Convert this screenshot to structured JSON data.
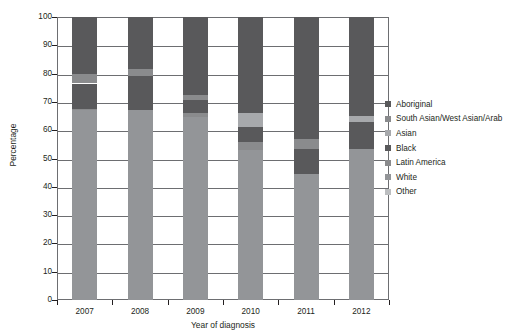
{
  "chart_data": {
    "type": "bar",
    "stacked": true,
    "title": "",
    "subtitle": "",
    "xlabel": "Year of diagnosis",
    "ylabel": "Percentage",
    "categories": [
      "2007",
      "2008",
      "2009",
      "2010",
      "2011",
      "2012"
    ],
    "ylim": [
      0,
      100
    ],
    "yticks": [
      0,
      10,
      20,
      30,
      40,
      50,
      60,
      70,
      80,
      90,
      100
    ],
    "ytick_labels": [
      "0",
      "10",
      "20",
      "30",
      "40",
      "50",
      "60",
      "70",
      "80",
      "90",
      "100"
    ],
    "grid": true,
    "grid_axis": "y",
    "legend_position": "right",
    "legend_entries": [
      "Aboriginal",
      "South Asian/West Asian/Arab",
      "Asian",
      "Black",
      "Latin America",
      "White",
      "Other"
    ],
    "series": [
      {
        "name": "Aboriginal",
        "color": "#59595b",
        "values": [
          20.0,
          18.5,
          27.5,
          34.0,
          43.0,
          35.0
        ]
      },
      {
        "name": "South Asian/West Asian/Arab",
        "color": "#8a8b8d",
        "values": [
          3.5,
          2.5,
          2.0,
          0.0,
          3.5,
          0.0
        ]
      },
      {
        "name": "Asian",
        "color": "#a7a9ac",
        "values": [
          0.0,
          0.0,
          0.0,
          5.0,
          0.0,
          2.0
        ]
      },
      {
        "name": "Black",
        "color": "#59595b",
        "values": [
          9.0,
          12.0,
          4.5,
          5.0,
          9.0,
          9.5
        ]
      },
      {
        "name": "Latin America",
        "color": "#8a8b8d",
        "values": [
          0.5,
          0.0,
          1.5,
          3.0,
          0.0,
          0.0
        ]
      },
      {
        "name": "White",
        "color": "#939598",
        "values": [
          67.0,
          67.0,
          64.5,
          53.0,
          44.5,
          53.5
        ]
      },
      {
        "name": "Other",
        "color": "#bcbec0",
        "values": [
          0.0,
          0.0,
          0.0,
          0.0,
          0.0,
          0.0
        ]
      }
    ],
    "stack_order_bottom_to_top": [
      "Other",
      "White",
      "Latin America",
      "Black",
      "Asian",
      "South Asian/West Asian/Arab",
      "Aboriginal"
    ],
    "colors": {
      "aboriginal": "#59595b",
      "south_asian_west_asian_arab": "#8a8b8d",
      "asian": "#a7a9ac",
      "black": "#59595b",
      "latin_america": "#8a8b8d",
      "white": "#939598",
      "other": "#bcbec0",
      "axis": "#231f20",
      "grid": "#6d6e71",
      "background": "#ffffff"
    }
  }
}
